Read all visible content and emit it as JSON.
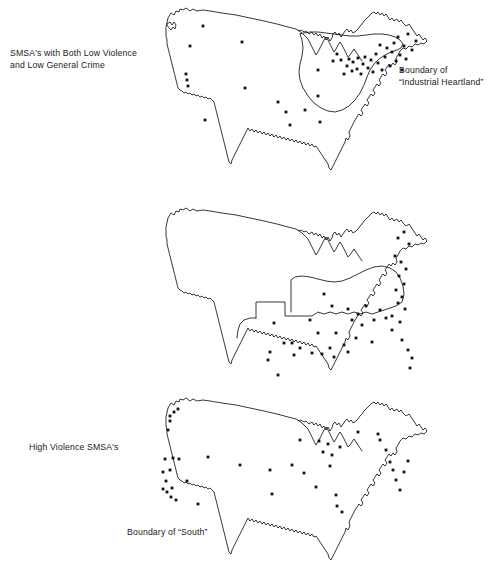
{
  "figure": {
    "title_present": false,
    "panel_count": 3,
    "dot_symbol": "filled-square-dot",
    "line_color": "#141414",
    "dot_color": "#111111",
    "background_color": "#ffffff"
  },
  "panels": [
    {
      "id": "panel-0",
      "main_label": "SMSA's with Both Low Violence\nand Low General Crime",
      "side_label": "Boundary of\n“Industrial Heartland”",
      "has_region_boundary": true,
      "region_name": "Industrial Heartland",
      "dot_count": 49
    },
    {
      "id": "panel-1",
      "main_label": "High Violence SMSA's",
      "side_label": "Boundary of “South”",
      "has_region_boundary": true,
      "region_name": "South",
      "dot_count": 48
    },
    {
      "id": "panel-2",
      "main_label": "High General Crime SMSA's",
      "side_label": "",
      "has_region_boundary": false,
      "region_name": "",
      "dot_count": 45
    }
  ],
  "chart_data": {
    "type": "scatter",
    "xlabel": "",
    "ylabel": "",
    "projection": "contiguous-united-states-outline",
    "series": [
      {
        "name": "SMSA's with Both Low Violence and Low General Crime",
        "panel": 0,
        "points": [
          [
            203,
            26
          ],
          [
            190,
            46
          ],
          [
            186,
            74
          ],
          [
            187,
            80
          ],
          [
            188,
            86
          ],
          [
            205,
            120
          ],
          [
            242,
            42
          ],
          [
            245,
            88
          ],
          [
            278,
            102
          ],
          [
            286,
            112
          ],
          [
            290,
            125
          ],
          [
            305,
            110
          ],
          [
            318,
            70
          ],
          [
            318,
            96
          ],
          [
            320,
            122
          ],
          [
            333,
            61
          ],
          [
            337,
            54
          ],
          [
            341,
            60
          ],
          [
            344,
            74
          ],
          [
            347,
            66
          ],
          [
            349,
            59
          ],
          [
            352,
            71
          ],
          [
            353,
            62
          ],
          [
            357,
            69
          ],
          [
            358,
            58
          ],
          [
            361,
            74
          ],
          [
            363,
            64
          ],
          [
            365,
            57
          ],
          [
            368,
            68
          ],
          [
            371,
            60
          ],
          [
            373,
            72
          ],
          [
            376,
            54
          ],
          [
            378,
            63
          ],
          [
            380,
            45
          ],
          [
            382,
            70
          ],
          [
            385,
            57
          ],
          [
            387,
            48
          ],
          [
            390,
            66
          ],
          [
            392,
            52
          ],
          [
            394,
            43
          ],
          [
            396,
            61
          ],
          [
            398,
            37
          ],
          [
            400,
            55
          ],
          [
            402,
            70
          ],
          [
            404,
            46
          ],
          [
            406,
            59
          ],
          [
            408,
            34
          ],
          [
            412,
            50
          ],
          [
            416,
            41
          ]
        ]
      },
      {
        "name": "High Violence SMSA's",
        "panel": 1,
        "points": [
          [
            398,
            238
          ],
          [
            404,
            232
          ],
          [
            409,
            244
          ],
          [
            395,
            256
          ],
          [
            401,
            262
          ],
          [
            406,
            269
          ],
          [
            399,
            276
          ],
          [
            404,
            284
          ],
          [
            396,
            290
          ],
          [
            402,
            297
          ],
          [
            398,
            303
          ],
          [
            405,
            309
          ],
          [
            392,
            316
          ],
          [
            400,
            322
          ],
          [
            324,
            294
          ],
          [
            332,
            306
          ],
          [
            348,
            309
          ],
          [
            358,
            314
          ],
          [
            366,
            306
          ],
          [
            352,
            320
          ],
          [
            362,
            325
          ],
          [
            374,
            320
          ],
          [
            380,
            310
          ],
          [
            386,
            318
          ],
          [
            392,
            330
          ],
          [
            310,
            320
          ],
          [
            318,
            333
          ],
          [
            336,
            333
          ],
          [
            344,
            345
          ],
          [
            356,
            338
          ],
          [
            330,
            348
          ],
          [
            372,
            342
          ],
          [
            274,
            323
          ],
          [
            284,
            343
          ],
          [
            292,
            343
          ],
          [
            270,
            352
          ],
          [
            268,
            360
          ],
          [
            278,
            375
          ],
          [
            294,
            355
          ],
          [
            300,
            348
          ],
          [
            312,
            353
          ],
          [
            322,
            354
          ],
          [
            334,
            357
          ],
          [
            348,
            352
          ],
          [
            402,
            340
          ],
          [
            408,
            350
          ],
          [
            412,
            358
          ],
          [
            410,
            368
          ]
        ]
      },
      {
        "name": "High General Crime SMSA's",
        "panel": 2,
        "points": [
          [
            170,
            416
          ],
          [
            174,
            412
          ],
          [
            178,
            409
          ],
          [
            170,
            421
          ],
          [
            168,
            430
          ],
          [
            173,
            458
          ],
          [
            179,
            459
          ],
          [
            165,
            459
          ],
          [
            163,
            472
          ],
          [
            170,
            470
          ],
          [
            166,
            481
          ],
          [
            163,
            489
          ],
          [
            167,
            492
          ],
          [
            172,
            488
          ],
          [
            171,
            497
          ],
          [
            176,
            500
          ],
          [
            187,
            481
          ],
          [
            198,
            504
          ],
          [
            208,
            457
          ],
          [
            240,
            465
          ],
          [
            270,
            470
          ],
          [
            272,
            494
          ],
          [
            300,
            440
          ],
          [
            292,
            465
          ],
          [
            304,
            473
          ],
          [
            316,
            487
          ],
          [
            330,
            466
          ],
          [
            336,
            495
          ],
          [
            337,
            506
          ],
          [
            342,
            512
          ],
          [
            319,
            441
          ],
          [
            323,
            452
          ],
          [
            328,
            444
          ],
          [
            332,
            455
          ],
          [
            340,
            447
          ],
          [
            358,
            432
          ],
          [
            378,
            434
          ],
          [
            380,
            440
          ],
          [
            386,
            450
          ],
          [
            390,
            462
          ],
          [
            393,
            470
          ],
          [
            396,
            480
          ],
          [
            400,
            490
          ],
          [
            404,
            472
          ],
          [
            408,
            461
          ]
        ]
      }
    ]
  }
}
